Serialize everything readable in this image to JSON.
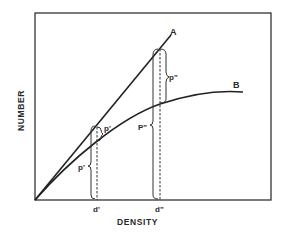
{
  "diagram": {
    "x_axis_label": "DENSITY",
    "y_axis_label": "NUMBER",
    "curves": [
      {
        "id": "A",
        "label": "A",
        "shape": "straight line from origin"
      },
      {
        "id": "B",
        "label": "B",
        "shape": "concave curve from origin, leveling off"
      }
    ],
    "x_ticks": [
      {
        "id": "d1",
        "label": "d'"
      },
      {
        "id": "d2",
        "label": "d\""
      }
    ],
    "braces": [
      {
        "id": "p1_lower",
        "label": "p'",
        "at": "d'",
        "span": "axis to curve B"
      },
      {
        "id": "p1_upper",
        "label": "p'",
        "at": "d'",
        "span": "curve B to line A"
      },
      {
        "id": "p2_lower",
        "label": "P\"",
        "at": "d\"",
        "span": "axis to curve B"
      },
      {
        "id": "p2_upper",
        "label": "p\"",
        "at": "d\"",
        "span": "curve B to line A"
      }
    ]
  }
}
